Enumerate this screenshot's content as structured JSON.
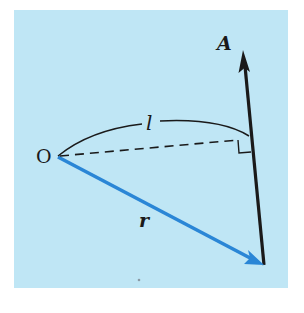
{
  "figure": {
    "background_color": "#bfe6f5",
    "labels": {
      "origin": "O",
      "vector_A": "A",
      "distance": "l",
      "position_vector": "r"
    },
    "colors": {
      "line_A": "#1a1a1a",
      "vector_r": "#2a86d6",
      "arc": "#1a1a1a",
      "dashed": "#1a1a1a"
    },
    "elements": [
      {
        "name": "vector-A",
        "desc": "black arrow pointing up, line of action"
      },
      {
        "name": "vector-r",
        "desc": "blue arrow from O to point on line A"
      },
      {
        "name": "perpendicular-distance",
        "desc": "dashed line from O to line A, right angle marker"
      },
      {
        "name": "distance-arc",
        "desc": "arc labeled l spanning O to foot of perpendicular"
      }
    ]
  }
}
